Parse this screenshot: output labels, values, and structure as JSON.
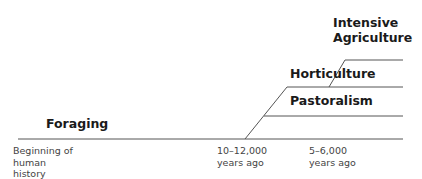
{
  "diagram": {
    "stages": [
      {
        "label": "Foraging"
      },
      {
        "label": "Pastoralism"
      },
      {
        "label": "Horticulture"
      },
      {
        "label": "Intensive\nAgriculture"
      }
    ],
    "time_labels": [
      {
        "label": "Beginning of\nhuman\nhistory"
      },
      {
        "label": "10–12,000\nyears ago"
      },
      {
        "label": "5–6,000\nyears ago"
      }
    ],
    "line_color": "#555555"
  }
}
